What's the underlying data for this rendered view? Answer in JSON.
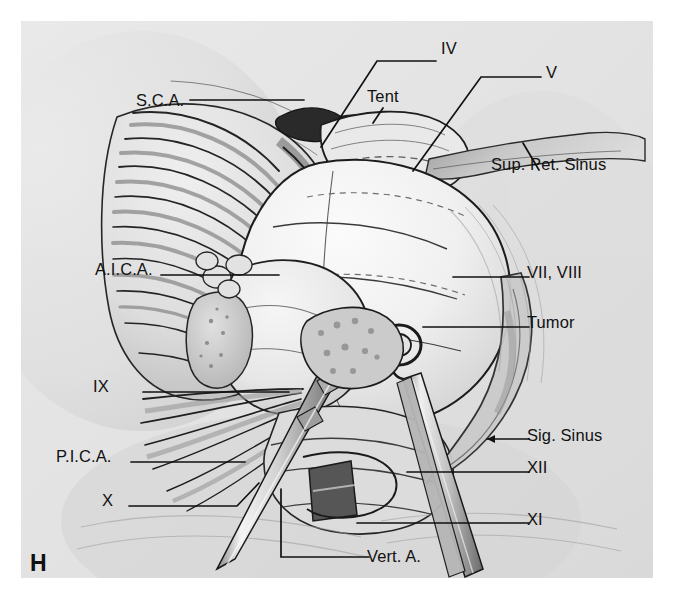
{
  "figure": {
    "panel_letter": "H",
    "type": "medical-illustration",
    "background_color": "#e4e4e4",
    "page_color": "#ffffff",
    "ink_color": "#111111"
  },
  "labels": [
    {
      "id": "sca",
      "text": "S.C.A.",
      "x": 136,
      "y": 92,
      "align": "left"
    },
    {
      "id": "iv",
      "text": "IV",
      "x": 441,
      "y": 40,
      "align": "left"
    },
    {
      "id": "tent",
      "text": "Tent",
      "x": 367,
      "y": 88,
      "align": "left"
    },
    {
      "id": "v",
      "text": "V",
      "x": 546,
      "y": 64,
      "align": "left"
    },
    {
      "id": "sup-pet",
      "text": "Sup. Pet. Sinus",
      "x": 491,
      "y": 156,
      "align": "left"
    },
    {
      "id": "aica",
      "text": "A.I.C.A.",
      "x": 95,
      "y": 261,
      "align": "left"
    },
    {
      "id": "vii-viii",
      "text": "VII, VIII",
      "x": 527,
      "y": 264,
      "align": "left"
    },
    {
      "id": "tumor",
      "text": "Tumor",
      "x": 527,
      "y": 314,
      "align": "left"
    },
    {
      "id": "ix",
      "text": "IX",
      "x": 93,
      "y": 378,
      "align": "left"
    },
    {
      "id": "sig-sinus",
      "text": "Sig. Sinus",
      "x": 527,
      "y": 427,
      "align": "left"
    },
    {
      "id": "pica",
      "text": "P.I.C.A.",
      "x": 56,
      "y": 448,
      "align": "left"
    },
    {
      "id": "xii",
      "text": "XII",
      "x": 527,
      "y": 459,
      "align": "left"
    },
    {
      "id": "x",
      "text": "X",
      "x": 102,
      "y": 492,
      "align": "left"
    },
    {
      "id": "xi",
      "text": "XI",
      "x": 527,
      "y": 511,
      "align": "left"
    },
    {
      "id": "vert-a",
      "text": "Vert. A.",
      "x": 367,
      "y": 548,
      "align": "left"
    }
  ],
  "panel": {
    "letter": "H",
    "x": 30,
    "y": 550
  }
}
